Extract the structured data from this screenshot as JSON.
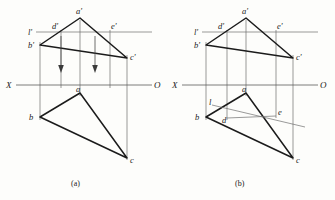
{
  "page": {
    "width": 335,
    "height": 200,
    "background": "#fdfdfb",
    "ink_heavy": "#1b1b1b",
    "ink_thin": "#6f6f6f"
  },
  "figures": [
    {
      "id": "figure-a",
      "caption": "(a)",
      "caption_pos": {
        "x": 76,
        "y": 184
      },
      "axis": {
        "left_label": "X",
        "right_label": "O",
        "y": 85,
        "x1": 16,
        "x2": 152,
        "left_label_pos": {
          "x": 8,
          "y": 88
        },
        "right_label_pos": {
          "x": 155,
          "y": 88
        }
      },
      "front_view": {
        "points": {
          "a_prime": {
            "x": 80,
            "y": 18,
            "label": "a'",
            "label_pos": {
              "x": 76,
              "y": 13
            }
          },
          "b_prime": {
            "x": 40,
            "y": 45,
            "label": "b'",
            "label_pos": {
              "x": 30,
              "y": 47
            }
          },
          "c_prime": {
            "x": 127,
            "y": 58,
            "label": "c'",
            "label_pos": {
              "x": 130,
              "y": 58
            }
          },
          "d_prime": {
            "x": 61,
            "y": 32,
            "label": "d'",
            "label_pos": {
              "x": 54,
              "y": 28
            }
          },
          "e_prime": {
            "x": 110,
            "y": 32,
            "label": "e'",
            "label_pos": {
              "x": 113,
              "y": 29
            }
          },
          "l_prime": {
            "x": 38,
            "y": 32,
            "label": "l'",
            "label_pos": {
              "x": 30,
              "y": 34
            }
          }
        },
        "triangle": "a'-b'-c'",
        "horizontal_line": {
          "name": "l'",
          "x1": 36,
          "x2": 152,
          "y": 32
        }
      },
      "top_view": {
        "points": {
          "a": {
            "x": 80,
            "y": 93,
            "label": "a",
            "label_pos": {
              "x": 76,
              "y": 91
            }
          },
          "b": {
            "x": 40,
            "y": 117,
            "label": "b",
            "label_pos": {
              "x": 31,
              "y": 119
            }
          },
          "c": {
            "x": 127,
            "y": 158,
            "label": "c",
            "label_pos": {
              "x": 130,
              "y": 161
            }
          }
        },
        "triangle": "a-b-c"
      },
      "projection_lines": [
        {
          "x": 40,
          "y1": 45,
          "y2": 117
        },
        {
          "x": 61,
          "y1": 32,
          "y2": 85
        },
        {
          "x": 80,
          "y1": 18,
          "y2": 93
        },
        {
          "x": 110,
          "y1": 32,
          "y2": 85
        },
        {
          "x": 127,
          "y1": 58,
          "y2": 158
        }
      ],
      "arrows": [
        {
          "x": 61,
          "y1": 36,
          "y2": 70,
          "direction": "down"
        },
        {
          "x": 95,
          "y1": 36,
          "y2": 70,
          "direction": "down"
        }
      ]
    },
    {
      "id": "figure-b",
      "caption": "(b)",
      "caption_pos": {
        "x": 240,
        "y": 184
      },
      "axis": {
        "left_label": "X",
        "right_label": "O",
        "y": 85,
        "x1": 182,
        "x2": 318,
        "left_label_pos": {
          "x": 174,
          "y": 88
        },
        "right_label_pos": {
          "x": 321,
          "y": 88
        }
      },
      "front_view": {
        "points": {
          "a_prime": {
            "x": 246,
            "y": 18,
            "label": "a'",
            "label_pos": {
              "x": 242,
              "y": 13
            }
          },
          "b_prime": {
            "x": 206,
            "y": 45,
            "label": "b'",
            "label_pos": {
              "x": 196,
              "y": 47
            }
          },
          "c_prime": {
            "x": 293,
            "y": 58,
            "label": "c'",
            "label_pos": {
              "x": 296,
              "y": 58
            }
          },
          "d_prime": {
            "x": 227,
            "y": 32,
            "label": "d'",
            "label_pos": {
              "x": 220,
              "y": 28
            }
          },
          "e_prime": {
            "x": 276,
            "y": 32,
            "label": "e'",
            "label_pos": {
              "x": 279,
              "y": 29
            }
          },
          "l_prime": {
            "x": 204,
            "y": 32,
            "label": "l'",
            "label_pos": {
              "x": 196,
              "y": 34
            }
          }
        },
        "triangle": "a'-b'-c'",
        "horizontal_line": {
          "name": "l'",
          "x1": 202,
          "x2": 318,
          "y": 32
        }
      },
      "top_view": {
        "points": {
          "a": {
            "x": 246,
            "y": 93,
            "label": "a",
            "label_pos": {
              "x": 242,
              "y": 91
            }
          },
          "b": {
            "x": 206,
            "y": 117,
            "label": "b",
            "label_pos": {
              "x": 197,
              "y": 119
            }
          },
          "c": {
            "x": 293,
            "y": 158,
            "label": "c",
            "label_pos": {
              "x": 296,
              "y": 161
            }
          },
          "d": {
            "x": 227,
            "y": 115,
            "label": "d",
            "label_pos": {
              "x": 223,
              "y": 120
            }
          },
          "e": {
            "x": 276,
            "y": 112,
            "label": "e",
            "label_pos": {
              "x": 279,
              "y": 112
            }
          },
          "l": {
            "x": 214,
            "y": 104,
            "label": "l",
            "label_pos": {
              "x": 210,
              "y": 104
            }
          }
        },
        "triangle": "a-b-c",
        "horizontal_line_projection": {
          "name": "l",
          "x1": 212,
          "y1": 105,
          "x2": 305,
          "y2": 127
        }
      },
      "projection_lines": [
        {
          "x": 206,
          "y1": 45,
          "y2": 117
        },
        {
          "x": 227,
          "y1": 32,
          "y2": 118
        },
        {
          "x": 246,
          "y1": 18,
          "y2": 93
        },
        {
          "x": 276,
          "y1": 32,
          "y2": 115
        },
        {
          "x": 293,
          "y1": 58,
          "y2": 158
        }
      ],
      "arrows": []
    }
  ]
}
